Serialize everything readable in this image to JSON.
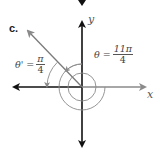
{
  "figure": {
    "part_label": "c.",
    "axes": {
      "x_label": "x",
      "y_label": "y"
    },
    "angle": {
      "symbol": "θ =",
      "numerator": "11π",
      "denominator": "4"
    },
    "reference_angle": {
      "symbol": "θ' =",
      "numerator": "π",
      "denominator": "4"
    },
    "terminal_side_degrees": 135,
    "colors": {
      "axis_dark": "#111111",
      "axis_gray": "#8a8a8a",
      "ray": "#7a7a7a",
      "arc": "#8a8a8a"
    }
  }
}
